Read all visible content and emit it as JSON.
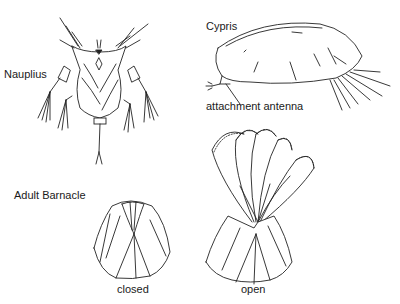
{
  "diagram": {
    "labels": {
      "nauplius": "Nauplius",
      "cypris": "Cypris",
      "attachment_antenna": "attachment antenna",
      "adult_barnacle": "Adult Barnacle",
      "closed": "closed",
      "open": "open"
    },
    "figures": [
      {
        "id": "nauplius",
        "label": "Nauplius"
      },
      {
        "id": "cypris",
        "label": "Cypris",
        "callout": "attachment antenna"
      },
      {
        "id": "adult-closed",
        "label": "closed"
      },
      {
        "id": "adult-open",
        "label": "open"
      }
    ],
    "colors": {
      "line": "#222222",
      "background": "#ffffff",
      "text": "#1a1a1a"
    }
  }
}
